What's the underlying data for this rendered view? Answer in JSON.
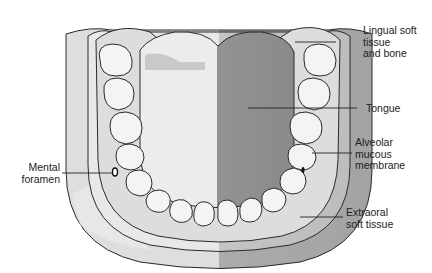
{
  "diagram": {
    "colors": {
      "extraoral_light": "#d9d9d9",
      "extraoral_dark": "#a9a9a9",
      "mucous_light": "#e6e6e6",
      "mucous_dark": "#b9b9b9",
      "gingiva": "#dcdcdc",
      "tongue_light": "#e9e9e9",
      "tongue_dark": "#8f8f8f",
      "tooth": "#f4f4f4",
      "outline": "#2a2a2a"
    },
    "labels": [
      {
        "id": "lingual",
        "lines": [
          "Lingual soft",
          "tissue",
          "and bone"
        ]
      },
      {
        "id": "tongue",
        "lines": [
          "Tongue"
        ]
      },
      {
        "id": "alveolar",
        "lines": [
          "Alveolar",
          "mucous",
          "membrane"
        ]
      },
      {
        "id": "mental",
        "lines": [
          "Mental",
          "foramen"
        ]
      },
      {
        "id": "extraoral",
        "lines": [
          "Extraoral",
          "soft tissue"
        ]
      }
    ]
  }
}
